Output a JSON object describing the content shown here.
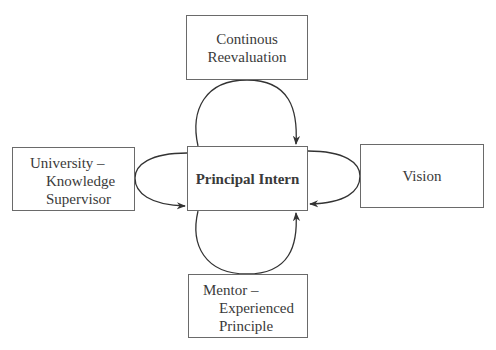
{
  "diagram": {
    "center": {
      "label": "Principal Intern"
    },
    "top": {
      "lines": [
        "Continous",
        "Reevaluation"
      ]
    },
    "left": {
      "lines": [
        "University –",
        "Knowledge",
        "Supervisor"
      ]
    },
    "right": {
      "lines": [
        "Vision"
      ]
    },
    "bottom": {
      "lines": [
        "Mentor –",
        "Experienced",
        "Principle"
      ]
    },
    "colors": {
      "line": "#333333",
      "box_border": "#6a6a6a",
      "text": "#3a3a3a"
    }
  }
}
